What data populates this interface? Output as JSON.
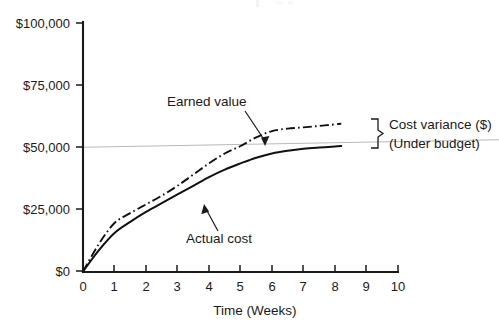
{
  "chart_data": {
    "type": "line",
    "title": "",
    "xlabel": "Time (Weeks)",
    "ylabel": "",
    "xlim": [
      0,
      10
    ],
    "ylim": [
      0,
      100000
    ],
    "grid": false,
    "legend_position": "inline-annotations",
    "x_ticks": [
      "0",
      "1",
      "2",
      "3",
      "4",
      "5",
      "6",
      "7",
      "8",
      "9",
      "10"
    ],
    "x_tick_values": [
      0,
      1,
      2,
      3,
      4,
      5,
      6,
      7,
      8,
      9,
      10
    ],
    "y_ticks": [
      "$0",
      "$25,000",
      "$50,000",
      "$75,000",
      "$100,000"
    ],
    "y_tick_values": [
      0,
      25000,
      50000,
      75000,
      100000
    ],
    "series": [
      {
        "name": "Earned value",
        "style": "dash-dot",
        "color": "#111111",
        "x": [
          0,
          0.5,
          1,
          1.5,
          2,
          2.5,
          3,
          3.5,
          4,
          4.5,
          5,
          5.5,
          6,
          6.5,
          7,
          7.5,
          8,
          8.2
        ],
        "values": [
          0,
          11000,
          19500,
          23500,
          27000,
          30500,
          34500,
          39000,
          43500,
          47500,
          50500,
          54000,
          56500,
          57500,
          58000,
          58600,
          59200,
          59500
        ]
      },
      {
        "name": "Actual cost",
        "style": "solid",
        "color": "#111111",
        "x": [
          0,
          0.5,
          1,
          1.5,
          2,
          2.5,
          3,
          3.5,
          4,
          4.5,
          5,
          5.5,
          6,
          6.5,
          7,
          7.5,
          8,
          8.2
        ],
        "values": [
          0,
          8500,
          15500,
          20000,
          24000,
          27500,
          31000,
          34500,
          38000,
          41000,
          43500,
          45800,
          47500,
          48600,
          49400,
          49900,
          50300,
          50500
        ]
      }
    ],
    "reference_line": {
      "name": "Budget at completion",
      "color": "#b9b9b9",
      "y_start": 50000,
      "y_end": 53000,
      "style": "thin-solid"
    },
    "annotations": [
      {
        "name": "earned-value-callout",
        "text": "Earned value",
        "points_to_x": 5.05,
        "points_to_y": 50500,
        "arrow": true
      },
      {
        "name": "actual-cost-callout",
        "text": "Actual cost",
        "points_to_x": 4.6,
        "points_to_y": 41800,
        "arrow": true
      },
      {
        "name": "cost-variance-brace",
        "text_line1": "Cost variance ($)",
        "text_line2": "(Under budget)",
        "brace": true,
        "spans_from_y": 50300,
        "spans_to_y": 59200,
        "at_x": 8.2
      }
    ]
  },
  "axis": {
    "x_title": "Time (Weeks)",
    "y_title": ""
  }
}
